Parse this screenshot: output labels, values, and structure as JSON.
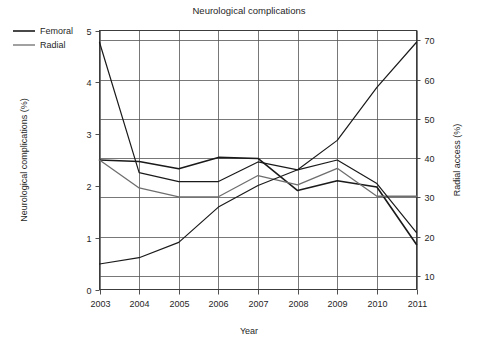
{
  "chart_data": {
    "type": "line",
    "title": "Neurological complications",
    "xlabel": "Year",
    "ylabel": "Neurological complications (%)",
    "y2label": "Radial access (%)",
    "grid": true,
    "legend_position": "top-left-outside",
    "x": [
      2003,
      2004,
      2005,
      2006,
      2007,
      2008,
      2009,
      2010,
      2011
    ],
    "xtick_labels": [
      "2003",
      "2004",
      "2005",
      "2006",
      "2007",
      "2008",
      "2009",
      "2010",
      "2011"
    ],
    "xlim": [
      2003,
      2011
    ],
    "ylim": [
      0,
      5
    ],
    "ytick_values": [
      0,
      1,
      2,
      3,
      4,
      5
    ],
    "ytick_labels": [
      "0",
      "1",
      "2",
      "3",
      "4",
      "5"
    ],
    "y2lim": [
      6.5,
      72.5
    ],
    "y2tick_values": [
      10,
      20,
      30,
      40,
      50,
      60,
      70
    ],
    "y2tick_labels": [
      "10",
      "20",
      "30",
      "40",
      "50",
      "60",
      "70"
    ],
    "gridline_axis": "right",
    "legend": [
      {
        "name": "Femoral",
        "color": "#1a1a1a",
        "width": 1.6
      },
      {
        "name": "Radial",
        "color": "#6e6e6e",
        "width": 1.3
      }
    ],
    "series": [
      {
        "name": "Femoral neurological complications",
        "axis": "left",
        "color": "#1a1a1a",
        "width": 1.6,
        "values": [
          2.5,
          2.47,
          2.33,
          2.55,
          2.53,
          1.91,
          2.1,
          1.98,
          0.87
        ]
      },
      {
        "name": "Radial neurological complications",
        "axis": "left",
        "color": "#6e6e6e",
        "width": 1.3,
        "values": [
          2.5,
          1.96,
          1.79,
          1.79,
          2.2,
          2.02,
          2.34,
          1.8,
          1.8
        ]
      },
      {
        "name": "Femoral access",
        "axis": "right",
        "color": "#1a1a1a",
        "width": 1.2,
        "values": [
          69.5,
          36.3,
          34.0,
          34.0,
          39.0,
          37.0,
          39.5,
          33.5,
          21.0
        ]
      },
      {
        "name": "Radial access",
        "axis": "right",
        "color": "#1a1a1a",
        "width": 1.2,
        "values": [
          13.0,
          14.6,
          18.5,
          27.5,
          33.0,
          37.0,
          44.5,
          58.0,
          69.5
        ]
      }
    ]
  },
  "footer": {
    "caption": ""
  }
}
